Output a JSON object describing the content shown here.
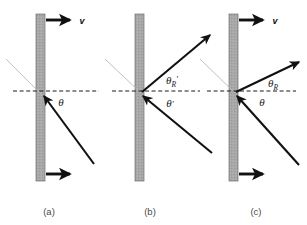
{
  "figure": {
    "background_color": "#ffffff",
    "width": 307,
    "height": 225
  },
  "style": {
    "mirror_fill": "#a8a8a8",
    "mirror_hatch": "#8f8f8f",
    "mirror_edge": "#6e6e6e",
    "ray_color": "#111111",
    "dashed_color": "#1a1a1a",
    "faint_line_color": "#b9b9b9",
    "caption_color": "#4a4a4a"
  },
  "panels": [
    {
      "id": "a",
      "caption": "(a)",
      "caption_x": 49,
      "caption_y": 215,
      "mirror": {
        "x": 36,
        "y": 14,
        "width": 9,
        "height": 167
      },
      "normal_line": {
        "x1": 13,
        "y1": 91,
        "x2": 99,
        "y2": 91,
        "label": "dashed-normal"
      },
      "velocity_arrows": [
        {
          "name": "velocity-arrow-top",
          "x1": 46,
          "y1": 20,
          "x2": 72,
          "y2": 20
        },
        {
          "name": "velocity-arrow-bottom",
          "x1": 46,
          "y1": 174,
          "x2": 72,
          "y2": 174
        }
      ],
      "velocity_label": {
        "text": "v",
        "x": 82,
        "y": 23
      },
      "incident_ray": {
        "x1": 94,
        "y1": 164,
        "x2": 42,
        "y2": 95,
        "arrow_at": "end"
      },
      "faint_line": {
        "x1": 6,
        "y1": 59,
        "x2": 42,
        "y2": 95
      },
      "angle_labels": [
        {
          "name": "angle-theta",
          "symbol": "θ",
          "subscript": "",
          "prime": "",
          "x": 61,
          "y": 105
        }
      ]
    },
    {
      "id": "b",
      "caption": "(b)",
      "caption_x": 150,
      "caption_y": 215,
      "mirror": {
        "x": 135,
        "y": 14,
        "width": 9,
        "height": 167
      },
      "normal_line": {
        "x1": 112,
        "y1": 91,
        "x2": 200,
        "y2": 91,
        "label": "dashed-normal"
      },
      "velocity_arrows": [],
      "velocity_label": null,
      "incident_ray": {
        "x1": 212,
        "y1": 153,
        "x2": 141,
        "y2": 95,
        "arrow_at": "end"
      },
      "reflected_ray": {
        "x1": 141,
        "y1": 92,
        "x2": 212,
        "y2": 33,
        "arrow_at": "end"
      },
      "faint_line": {
        "x1": 105,
        "y1": 59,
        "x2": 141,
        "y2": 93
      },
      "angle_labels": [
        {
          "name": "angle-theta-r-prime",
          "symbol": "θ",
          "subscript": "R",
          "prime": "′",
          "x": 172,
          "y": 83
        },
        {
          "name": "angle-theta-prime",
          "symbol": "θ",
          "subscript": "",
          "prime": "′",
          "x": 170,
          "y": 106
        }
      ]
    },
    {
      "id": "c",
      "caption": "(c)",
      "caption_x": 256,
      "caption_y": 215,
      "mirror": {
        "x": 229,
        "y": 14,
        "width": 9,
        "height": 167
      },
      "normal_line": {
        "x1": 207,
        "y1": 91,
        "x2": 296,
        "y2": 91,
        "label": "dashed-normal"
      },
      "velocity_arrows": [
        {
          "name": "velocity-arrow-top",
          "x1": 239,
          "y1": 20,
          "x2": 265,
          "y2": 20
        },
        {
          "name": "velocity-arrow-bottom",
          "x1": 239,
          "y1": 174,
          "x2": 265,
          "y2": 174
        }
      ],
      "velocity_label": {
        "text": "v",
        "x": 275,
        "y": 23
      },
      "incident_ray": {
        "x1": 299,
        "y1": 165,
        "x2": 235,
        "y2": 95,
        "arrow_at": "end"
      },
      "reflected_ray": {
        "x1": 235,
        "y1": 92,
        "x2": 301,
        "y2": 60,
        "arrow_at": "end"
      },
      "faint_line": {
        "x1": 200,
        "y1": 59,
        "x2": 235,
        "y2": 93
      },
      "angle_labels": [
        {
          "name": "angle-theta-r",
          "symbol": "θ",
          "subscript": "R",
          "prime": "",
          "x": 273,
          "y": 86
        },
        {
          "name": "angle-theta",
          "symbol": "θ",
          "subscript": "",
          "prime": "",
          "x": 262,
          "y": 105
        }
      ]
    }
  ]
}
